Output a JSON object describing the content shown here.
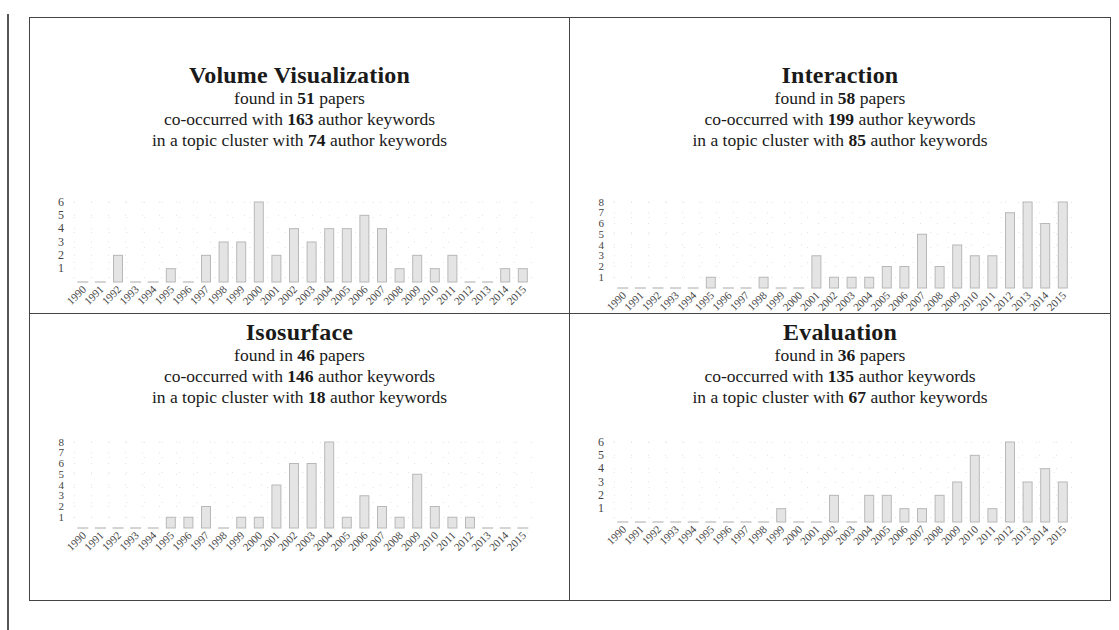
{
  "panels": [
    {
      "keyword": "Volume Visualization",
      "found_prefix": "found in ",
      "found_count": "51",
      "found_suffix": " papers",
      "co_prefix": "co-occurred with ",
      "co_count": "163",
      "co_suffix": " author keywords",
      "cluster_prefix": "in a topic cluster with ",
      "cluster_count": "74",
      "cluster_suffix": " author keywords"
    },
    {
      "keyword": "Interaction",
      "found_prefix": "found in ",
      "found_count": "58",
      "found_suffix": " papers",
      "co_prefix": "co-occurred with ",
      "co_count": "199",
      "co_suffix": " author keywords",
      "cluster_prefix": "in a topic cluster with ",
      "cluster_count": "85",
      "cluster_suffix": " author keywords"
    },
    {
      "keyword": "Isosurface",
      "found_prefix": "found in ",
      "found_count": "46",
      "found_suffix": " papers",
      "co_prefix": "co-occurred with ",
      "co_count": "146",
      "co_suffix": " author keywords",
      "cluster_prefix": "in a topic cluster with ",
      "cluster_count": "18",
      "cluster_suffix": " author keywords"
    },
    {
      "keyword": "Evaluation",
      "found_prefix": "found in ",
      "found_count": "36",
      "found_suffix": " papers",
      "co_prefix": "co-occurred with ",
      "co_count": "135",
      "co_suffix": " author keywords",
      "cluster_prefix": "in a topic cluster with ",
      "cluster_count": "67",
      "cluster_suffix": " author keywords"
    }
  ],
  "colors": {
    "bar_fill": "#e4e4e4",
    "bar_stroke": "#b8b8b8",
    "border": "#444444",
    "grid_dot": "#e2e2e2"
  },
  "chart_data": [
    {
      "type": "bar",
      "title": "Volume Visualization",
      "categories": [
        "1990",
        "1991",
        "1992",
        "1993",
        "1994",
        "1995",
        "1996",
        "1997",
        "1998",
        "1999",
        "2000",
        "2001",
        "2002",
        "2003",
        "2004",
        "2005",
        "2006",
        "2007",
        "2008",
        "2009",
        "2010",
        "2011",
        "2012",
        "2013",
        "2014",
        "2015"
      ],
      "values": [
        0,
        0,
        2,
        0,
        0,
        1,
        0,
        2,
        3,
        3,
        6,
        2,
        4,
        3,
        4,
        4,
        5,
        4,
        1,
        2,
        1,
        2,
        0,
        0,
        1,
        1
      ],
      "yticks": [
        1,
        2,
        3,
        4,
        5,
        6
      ],
      "ylim": [
        0,
        6
      ],
      "xlabel": "",
      "ylabel": "",
      "grid": "dotted"
    },
    {
      "type": "bar",
      "title": "Interaction",
      "categories": [
        "1990",
        "1991",
        "1992",
        "1993",
        "1994",
        "1995",
        "1996",
        "1997",
        "1998",
        "1999",
        "2000",
        "2001",
        "2002",
        "2003",
        "2004",
        "2005",
        "2006",
        "2007",
        "2008",
        "2009",
        "2010",
        "2011",
        "2012",
        "2013",
        "2014",
        "2015"
      ],
      "values": [
        0,
        0,
        0,
        0,
        0,
        1,
        0,
        0,
        1,
        0,
        0,
        3,
        1,
        1,
        1,
        2,
        2,
        5,
        2,
        4,
        3,
        3,
        7,
        8,
        6,
        8
      ],
      "yticks": [
        1,
        2,
        3,
        4,
        5,
        6,
        7,
        8
      ],
      "ylim": [
        0,
        8
      ],
      "xlabel": "",
      "ylabel": "",
      "grid": "dotted"
    },
    {
      "type": "bar",
      "title": "Isosurface",
      "categories": [
        "1990",
        "1991",
        "1992",
        "1993",
        "1994",
        "1995",
        "1996",
        "1997",
        "1998",
        "1999",
        "2000",
        "2001",
        "2002",
        "2003",
        "2004",
        "2005",
        "2006",
        "2007",
        "2008",
        "2009",
        "2010",
        "2011",
        "2012",
        "2013",
        "2014",
        "2015"
      ],
      "values": [
        0,
        0,
        0,
        0,
        0,
        1,
        1,
        2,
        0,
        1,
        1,
        4,
        6,
        6,
        8,
        1,
        3,
        2,
        1,
        5,
        2,
        1,
        1,
        0,
        0,
        0
      ],
      "yticks": [
        1,
        2,
        3,
        4,
        5,
        6,
        7,
        8
      ],
      "ylim": [
        0,
        8
      ],
      "xlabel": "",
      "ylabel": "",
      "grid": "dotted"
    },
    {
      "type": "bar",
      "title": "Evaluation",
      "categories": [
        "1990",
        "1991",
        "1992",
        "1993",
        "1994",
        "1995",
        "1996",
        "1997",
        "1998",
        "1999",
        "2000",
        "2001",
        "2002",
        "2003",
        "2004",
        "2005",
        "2006",
        "2007",
        "2008",
        "2009",
        "2010",
        "2011",
        "2012",
        "2013",
        "2014",
        "2015"
      ],
      "values": [
        0,
        0,
        0,
        0,
        0,
        0,
        0,
        0,
        0,
        1,
        0,
        0,
        2,
        0,
        2,
        2,
        1,
        1,
        2,
        3,
        5,
        1,
        6,
        3,
        4,
        3
      ],
      "yticks": [
        1,
        2,
        3,
        4,
        5,
        6
      ],
      "ylim": [
        0,
        6
      ],
      "xlabel": "",
      "ylabel": "",
      "grid": "dotted"
    }
  ]
}
